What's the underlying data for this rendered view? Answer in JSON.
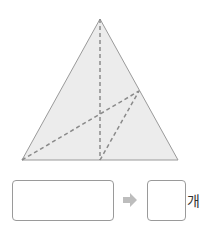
{
  "figure": {
    "shape": "triangle",
    "fill": "#ececec",
    "stroke": "#9a9a9a",
    "dash_color": "#8a8a8a",
    "vertices": {
      "top": [
        100,
        19
      ],
      "bottom_left": [
        22,
        160
      ],
      "bottom_right": [
        178,
        160
      ]
    },
    "points": {
      "bottom_mid": [
        100,
        160
      ],
      "right_side": [
        139,
        91
      ]
    }
  },
  "answer": {
    "expression_box": "",
    "count_box": "",
    "arrow_icon": "right-arrow-icon",
    "unit_label": "개"
  }
}
